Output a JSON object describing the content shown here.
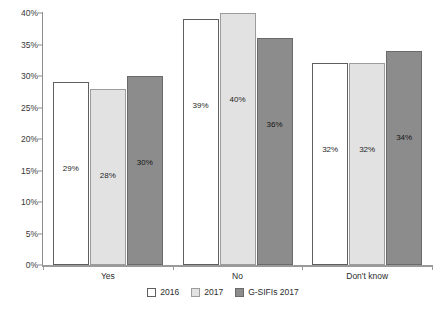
{
  "chart_data": {
    "type": "bar",
    "title": "",
    "subtitle": "",
    "xlabel": "",
    "ylabel": "",
    "categories": [
      "Yes",
      "No",
      "Don't know"
    ],
    "series": [
      {
        "name": "2016",
        "values": [
          29,
          39,
          32
        ],
        "color": "#ffffff"
      },
      {
        "name": "2017",
        "values": [
          28,
          40,
          32
        ],
        "color": "#e2e2e2"
      },
      {
        "name": "G-SIFIs 2017",
        "values": [
          30,
          36,
          34
        ],
        "color": "#8c8c8c"
      }
    ],
    "value_labels": [
      [
        "29%",
        "39%",
        "32%"
      ],
      [
        "28%",
        "40%",
        "32%"
      ],
      [
        "30%",
        "36%",
        "34%"
      ]
    ],
    "ylim": [
      0,
      40
    ],
    "ytick_values": [
      0,
      5,
      10,
      15,
      20,
      25,
      30,
      35,
      40
    ],
    "ytick_labels": [
      "0%",
      "5%",
      "10%",
      "15%",
      "20%",
      "25%",
      "30%",
      "35%",
      "40%"
    ],
    "grid": false,
    "legend_position": "bottom-center",
    "value_label_placement": "inside-bar"
  },
  "legend": {
    "items": [
      {
        "label": "2016",
        "swatch": "white-square-swatch"
      },
      {
        "label": "2017",
        "swatch": "light-gray-square-swatch"
      },
      {
        "label": "G-SIFIs 2017",
        "swatch": "dark-gray-square-swatch"
      }
    ]
  },
  "colors": {
    "series_2016": "#ffffff",
    "series_2017": "#e2e2e2",
    "series_gsifis_2017": "#8c8c8c",
    "axis": "#9a9a9a",
    "text": "#2b2b2b",
    "background": "#ffffff"
  }
}
